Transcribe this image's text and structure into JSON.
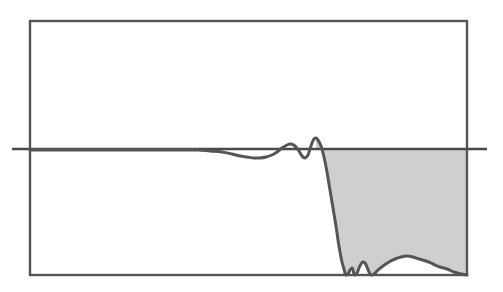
{
  "figure": {
    "width": 503,
    "height": 292,
    "background_color": "#ffffff",
    "title": "",
    "caption": ""
  },
  "style": {
    "frame_color": "#555555",
    "frame_width": 2.4,
    "curve_color": "#555555",
    "curve_width": 3.0,
    "reference_line_color": "#4a4a4a",
    "reference_line_width": 2.6,
    "fill_color": "#cfcfcf",
    "fill_opacity": 1
  },
  "axes": {
    "frame": {
      "left": 30,
      "top": 21,
      "right": 467,
      "bottom": 275
    },
    "grid": false,
    "xlabel": "",
    "ylabel": "",
    "xticks": [],
    "yticks": [],
    "xlim": [
      0,
      1
    ],
    "ylim": [
      0,
      1
    ]
  },
  "reference_line": {
    "name": "passband-reference-level",
    "orientation": "horizontal",
    "y_px": 149,
    "x_start_px": 12,
    "x_end_px": 487,
    "label": "",
    "extends_beyond_frame": true
  },
  "stopband_fill": {
    "name": "stopband-shaded-region",
    "x_start_px": 316,
    "x_end_px": 467,
    "y_top_px": 149,
    "y_bottom_px": 275,
    "label": ""
  },
  "chart_data": {
    "type": "line",
    "title": "",
    "subtitle": "",
    "xlabel": "",
    "ylabel": "",
    "xlim": [
      0,
      1
    ],
    "ylim": [
      0,
      1
    ],
    "grid": false,
    "legend": [],
    "annotations": [],
    "series": [
      {
        "name": "magnitude-response",
        "color": "#555555",
        "points_px": [
          [
            30,
            150
          ],
          [
            50,
            150
          ],
          [
            70,
            150
          ],
          [
            90,
            150
          ],
          [
            110,
            150
          ],
          [
            130,
            150
          ],
          [
            150,
            150
          ],
          [
            170,
            150
          ],
          [
            185,
            150
          ],
          [
            198,
            150
          ],
          [
            210,
            151
          ],
          [
            222,
            152
          ],
          [
            232,
            154
          ],
          [
            240,
            156
          ],
          [
            247,
            157
          ],
          [
            254,
            158
          ],
          [
            260,
            158
          ],
          [
            266,
            157
          ],
          [
            272,
            155
          ],
          [
            277,
            152
          ],
          [
            282,
            148
          ],
          [
            287,
            145
          ],
          [
            291,
            144
          ],
          [
            295,
            146
          ],
          [
            299,
            151
          ],
          [
            302,
            156
          ],
          [
            305,
            158
          ],
          [
            308,
            155
          ],
          [
            310,
            149
          ],
          [
            312,
            143
          ],
          [
            314,
            139
          ],
          [
            316,
            138
          ],
          [
            318,
            140
          ],
          [
            321,
            146
          ],
          [
            324,
            157
          ],
          [
            327,
            172
          ],
          [
            330,
            190
          ],
          [
            333,
            208
          ],
          [
            336,
            226
          ],
          [
            338,
            240
          ],
          [
            340,
            252
          ],
          [
            342,
            262
          ],
          [
            344,
            269
          ],
          [
            345,
            273
          ],
          [
            346,
            275
          ],
          [
            348,
            274
          ],
          [
            350,
            270
          ],
          [
            352,
            268
          ],
          [
            353,
            270
          ],
          [
            354,
            274
          ],
          [
            355,
            275
          ],
          [
            357,
            273
          ],
          [
            359,
            268
          ],
          [
            361,
            264
          ],
          [
            363,
            262
          ],
          [
            365,
            263
          ],
          [
            367,
            267
          ],
          [
            369,
            272
          ],
          [
            371,
            275
          ],
          [
            374,
            274
          ],
          [
            378,
            270
          ],
          [
            383,
            266
          ],
          [
            389,
            262
          ],
          [
            395,
            259
          ],
          [
            401,
            257
          ],
          [
            407,
            256
          ],
          [
            413,
            257
          ],
          [
            419,
            259
          ],
          [
            426,
            261
          ],
          [
            433,
            264
          ],
          [
            440,
            267
          ],
          [
            447,
            269
          ],
          [
            454,
            272
          ],
          [
            461,
            274
          ],
          [
            467,
            275
          ]
        ],
        "description": "flat passband with small ripple, sharp transition rolloff, stopband sidelobes along baseline"
      }
    ]
  }
}
